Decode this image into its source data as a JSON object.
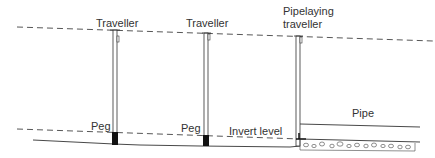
{
  "diagram": {
    "type": "pipe laying with travellers and sight rails (side elevation)",
    "labels": {
      "traveller_1": "Traveller",
      "traveller_2": "Traveller",
      "pipelaying_traveller_line1": "Pipelaying",
      "pipelaying_traveller_line2": "traveller",
      "peg_1": "Peg",
      "peg_2": "Peg",
      "invert_level": "Invert level",
      "pipe": "Pipe"
    },
    "colors": {
      "line": "#333333",
      "peg_fill": "#111111",
      "background": "#ffffff"
    }
  }
}
